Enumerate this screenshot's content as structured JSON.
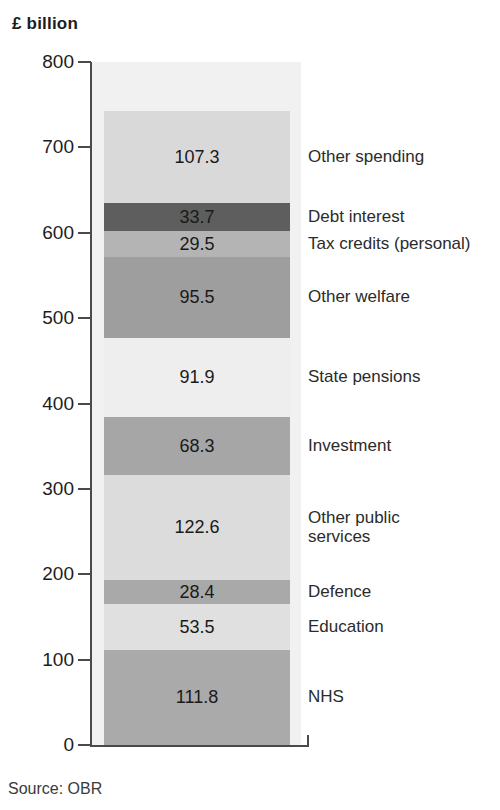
{
  "chart_data": {
    "type": "bar",
    "title": "£ billion",
    "subtitle": "",
    "xlabel": "",
    "ylabel": "£ billion",
    "ylim": [
      0,
      800
    ],
    "yticks": [
      0,
      100,
      200,
      300,
      400,
      500,
      600,
      700,
      800
    ],
    "ytick_labels": [
      "0",
      "100",
      "200",
      "300",
      "400",
      "500",
      "600",
      "700",
      "800"
    ],
    "grid": false,
    "legend_position": "right-inline-labels",
    "orientation": "vertical-stacked",
    "categories": [
      "Single stacked column"
    ],
    "stack_order": "bottom-to-top",
    "total": 742.5,
    "source": "Source: OBR",
    "series": [
      {
        "name": "NHS",
        "value": 111.8,
        "cum_bottom": 0.0,
        "cum_top": 111.8,
        "color": "#aaaaaa",
        "label": "NHS"
      },
      {
        "name": "Education",
        "value": 53.5,
        "cum_bottom": 111.8,
        "cum_top": 165.3,
        "color": "#e0e0e0",
        "label": "Education"
      },
      {
        "name": "Defence",
        "value": 28.4,
        "cum_bottom": 165.3,
        "cum_top": 193.7,
        "color": "#a9a9a9",
        "label": "Defence"
      },
      {
        "name": "Other public services",
        "value": 122.6,
        "cum_bottom": 193.7,
        "cum_top": 316.3,
        "color": "#dcdcdc",
        "label": "Other public\nservices"
      },
      {
        "name": "Investment",
        "value": 68.3,
        "cum_bottom": 316.3,
        "cum_top": 384.6,
        "color": "#a6a6a6",
        "label": "Investment"
      },
      {
        "name": "State pensions",
        "value": 91.9,
        "cum_bottom": 384.6,
        "cum_top": 476.5,
        "color": "#eeeeee",
        "label": "State pensions"
      },
      {
        "name": "Other welfare",
        "value": 95.5,
        "cum_bottom": 476.5,
        "cum_top": 572.0,
        "color": "#9e9e9e",
        "label": "Other welfare"
      },
      {
        "name": "Tax credits (personal)",
        "value": 29.5,
        "cum_bottom": 572.0,
        "cum_top": 601.5,
        "color": "#b4b4b4",
        "label": "Tax credits (personal)"
      },
      {
        "name": "Debt interest",
        "value": 33.7,
        "cum_bottom": 601.5,
        "cum_top": 635.2,
        "color": "#5e5e5e",
        "label": "Debt interest"
      },
      {
        "name": "Other spending",
        "value": 107.3,
        "cum_bottom": 635.2,
        "cum_top": 742.5,
        "color": "#d9d9d9",
        "label": "Other spending"
      }
    ],
    "value_labels": [
      "111.8",
      "53.5",
      "28.4",
      "122.6",
      "68.3",
      "91.9",
      "95.5",
      "29.5",
      "33.7",
      "107.3"
    ]
  },
  "colors": {
    "axis": "#4a4a4a",
    "text": "#2b2b2b",
    "plot_background": "#f1f1f1",
    "page_background": "#ffffff"
  },
  "source_note": "Source: OBR"
}
